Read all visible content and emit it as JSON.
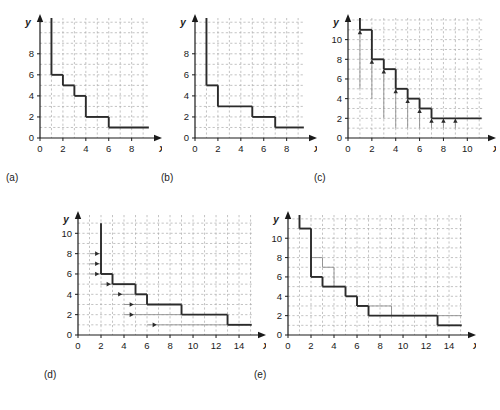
{
  "figure": {
    "type": "multi-panel-step-plots",
    "panel_count": 5,
    "background": "#ffffff",
    "line_color": "#2b2b2b",
    "grid_color": "#a9a9a9",
    "axis_color": "#1a1a1a",
    "thin_color": "#8c8c8c"
  },
  "panels": [
    {
      "id": "a",
      "label": "(a)",
      "xlabel": "x",
      "ylabel": "y",
      "xticks": [
        0,
        2,
        4,
        6,
        8
      ],
      "yticks": [
        0,
        2,
        4,
        6,
        8
      ],
      "xlim": [
        0,
        9.6
      ],
      "ylim": [
        0,
        11.4
      ],
      "grid": true,
      "steps": [
        {
          "x0": 1,
          "x1": 2,
          "y": 6
        },
        {
          "x0": 2,
          "x1": 3,
          "y": 5
        },
        {
          "x0": 3,
          "x1": 4,
          "y": 4
        },
        {
          "x0": 4,
          "x1": 6,
          "y": 2
        },
        {
          "x0": 6,
          "x1": 9.5,
          "y": 1
        }
      ],
      "entry_vertical": {
        "x": 1,
        "y_top": 11.4,
        "y_bottom": 6
      },
      "arrows": [],
      "drops": [],
      "thin_steps": []
    },
    {
      "id": "b",
      "label": "(b)",
      "xlabel": "x",
      "ylabel": "y",
      "xticks": [
        0,
        2,
        4,
        6,
        8
      ],
      "yticks": [
        0,
        2,
        4,
        6,
        8
      ],
      "xlim": [
        0,
        9.6
      ],
      "ylim": [
        0,
        11.4
      ],
      "grid": true,
      "steps": [
        {
          "x0": 1,
          "x1": 2,
          "y": 5
        },
        {
          "x0": 2,
          "x1": 5,
          "y": 3
        },
        {
          "x0": 5,
          "x1": 7,
          "y": 2
        },
        {
          "x0": 7,
          "x1": 9.5,
          "y": 1
        }
      ],
      "entry_vertical": {
        "x": 1,
        "y_top": 11.4,
        "y_bottom": 5
      },
      "arrows": [],
      "drops": [],
      "thin_steps": []
    },
    {
      "id": "c",
      "label": "(c)",
      "xlabel": "x",
      "ylabel": "y",
      "xticks": [
        0,
        2,
        4,
        6,
        8,
        10
      ],
      "yticks": [
        0,
        2,
        4,
        6,
        8,
        10
      ],
      "xlim": [
        0,
        11.4
      ],
      "ylim": [
        0,
        12.2
      ],
      "grid": true,
      "steps": [
        {
          "x0": 1,
          "x1": 2,
          "y": 11
        },
        {
          "x0": 2,
          "x1": 3,
          "y": 8
        },
        {
          "x0": 3,
          "x1": 4,
          "y": 7
        },
        {
          "x0": 4,
          "x1": 5,
          "y": 5
        },
        {
          "x0": 5,
          "x1": 6,
          "y": 4
        },
        {
          "x0": 6,
          "x1": 7,
          "y": 3
        },
        {
          "x0": 7,
          "x1": 11.2,
          "y": 2
        }
      ],
      "entry_vertical": {
        "x": 1,
        "y_top": 12.2,
        "y_bottom": 11
      },
      "drops": [
        {
          "x": 1,
          "y_from": 11,
          "y_to": 5
        },
        {
          "x": 2,
          "y_from": 8,
          "y_to": 4
        },
        {
          "x": 3,
          "y_from": 7,
          "y_to": 2
        },
        {
          "x": 4,
          "y_from": 5,
          "y_to": 1
        },
        {
          "x": 5,
          "y_from": 4,
          "y_to": 1
        },
        {
          "x": 6,
          "y_from": 3,
          "y_to": 1
        },
        {
          "x": 7,
          "y_from": 2,
          "y_to": 1
        },
        {
          "x": 8,
          "y_from": 2,
          "y_to": 1
        },
        {
          "x": 9,
          "y_from": 2,
          "y_to": 1
        }
      ],
      "arrows": [],
      "thin_steps": []
    },
    {
      "id": "d",
      "label": "(d)",
      "xlabel": "x",
      "ylabel": "y",
      "xticks": [
        0,
        2,
        4,
        6,
        8,
        10,
        12,
        14
      ],
      "yticks": [
        0,
        2,
        4,
        6,
        8,
        10
      ],
      "xlim": [
        0,
        15.3
      ],
      "ylim": [
        0,
        11.8
      ],
      "grid": true,
      "steps": [
        {
          "x0": 2,
          "x1": 3,
          "y": 6
        },
        {
          "x0": 3,
          "x1": 5,
          "y": 5
        },
        {
          "x0": 5,
          "x1": 6,
          "y": 4
        },
        {
          "x0": 6,
          "x1": 9,
          "y": 3
        },
        {
          "x0": 9,
          "x1": 13,
          "y": 2
        },
        {
          "x0": 13,
          "x1": 15.1,
          "y": 1
        }
      ],
      "entry_vertical": {
        "x": 2,
        "y_top": 11,
        "y_bottom": 6
      },
      "arrows": [
        {
          "y": 8,
          "x_from": 1,
          "x_to": 2
        },
        {
          "y": 7,
          "x_from": 1,
          "x_to": 2
        },
        {
          "y": 6,
          "x_from": 1,
          "x_to": 2
        },
        {
          "y": 5,
          "x_from": 2,
          "x_to": 3
        },
        {
          "y": 4,
          "x_from": 3,
          "x_to": 6
        },
        {
          "y": 3,
          "x_from": 4,
          "x_to": 6
        },
        {
          "y": 2,
          "x_from": 4,
          "x_to": 9
        },
        {
          "y": 1,
          "x_from": 6,
          "x_to": 13
        }
      ],
      "drops": [],
      "thin_steps": []
    },
    {
      "id": "e",
      "label": "(e)",
      "xlabel": "x",
      "ylabel": "y",
      "xticks": [
        0,
        2,
        4,
        6,
        8,
        10,
        12,
        14
      ],
      "yticks": [
        0,
        2,
        4,
        6,
        8,
        10
      ],
      "xlim": [
        0,
        15.3
      ],
      "ylim": [
        0,
        12.4
      ],
      "grid": true,
      "steps": [
        {
          "x0": 1,
          "x1": 2,
          "y": 11
        },
        {
          "x0": 2,
          "x1": 3,
          "y": 6
        },
        {
          "x0": 3,
          "x1": 5,
          "y": 5
        },
        {
          "x0": 5,
          "x1": 6,
          "y": 4
        },
        {
          "x0": 6,
          "x1": 7,
          "y": 3
        },
        {
          "x0": 7,
          "x1": 13,
          "y": 2
        },
        {
          "x0": 13,
          "x1": 15.1,
          "y": 1
        }
      ],
      "entry_vertical": {
        "x": 1,
        "y_top": 12.4,
        "y_bottom": 11
      },
      "thin_steps": [
        {
          "x0": 2,
          "x1": 3,
          "y": 8
        },
        {
          "x0": 3,
          "x1": 4,
          "y": 7
        },
        {
          "x0": 7,
          "x1": 9,
          "y": 3
        },
        {
          "x0": 9,
          "x1": 15.1,
          "y": 2
        }
      ],
      "thin_connectors": [
        {
          "x": 2,
          "y_from": 8,
          "y_to": 6
        },
        {
          "x": 3,
          "y_from": 8,
          "y_to": 7
        },
        {
          "x": 4,
          "y_from": 7,
          "y_to": 5
        },
        {
          "x": 7,
          "y_from": 3,
          "y_to": 2
        },
        {
          "x": 9,
          "y_from": 3,
          "y_to": 2
        }
      ],
      "arrows": [],
      "drops": []
    }
  ]
}
